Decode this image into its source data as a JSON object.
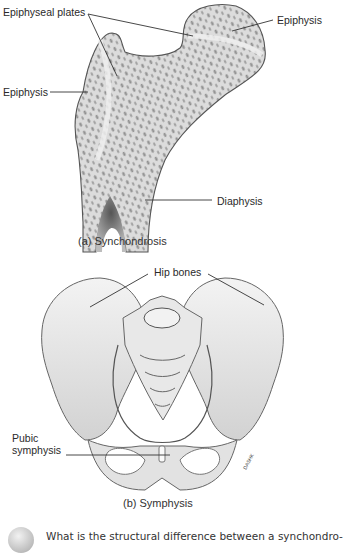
{
  "figure_a": {
    "labels": {
      "epiphyseal_plates": "Epiphyseal plates",
      "epiphysis_right": "Epiphysis",
      "epiphysis_left": "Epiphysis",
      "diaphysis": "Diaphysis"
    },
    "caption": "(a) Synchondrosis"
  },
  "figure_b": {
    "labels": {
      "hip_bones": "Hip bones",
      "pubic_symphysis_line1": "Pubic",
      "pubic_symphysis_line2": "symphysis"
    },
    "caption": "(b) Symphysis",
    "signature": "DASHK"
  },
  "question": {
    "icon": "question-bubble-icon",
    "text": "What is the structural difference between a synchondro-"
  },
  "colors": {
    "bone_fill": "#e4e4e4",
    "bone_outline": "#555555",
    "leader_line": "#333333",
    "label_text": "#2a2a2a"
  }
}
